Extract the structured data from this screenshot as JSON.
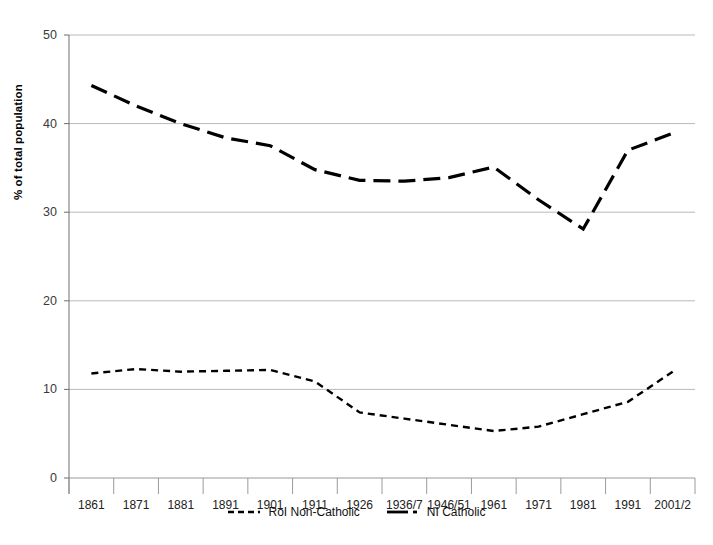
{
  "chart_data": {
    "type": "line",
    "title": "",
    "xlabel": "",
    "ylabel": "% of total population",
    "ylim": [
      0,
      50
    ],
    "yticks": [
      0,
      10,
      20,
      30,
      40,
      50
    ],
    "ytick_labels": [
      "0",
      "10",
      "20",
      "30",
      "40",
      "50"
    ],
    "grid": "horizontal",
    "legend_position": "bottom",
    "categories": [
      "1861",
      "1871",
      "1881",
      "1891",
      "1901",
      "1911",
      "1926",
      "1936/7",
      "1946/51",
      "1961",
      "1971",
      "1981",
      "1991",
      "2001/2"
    ],
    "series": [
      {
        "name": "RoI Non-Catholic",
        "style": "short-dash",
        "color": "#000000",
        "values": [
          11.8,
          12.3,
          12.0,
          12.1,
          12.2,
          10.9,
          7.4,
          6.7,
          6.0,
          5.3,
          5.8,
          7.2,
          8.6,
          12.0
        ]
      },
      {
        "name": "NI Catholic",
        "style": "long-dash",
        "color": "#000000",
        "values": [
          44.3,
          42.0,
          40.0,
          38.4,
          37.5,
          34.8,
          33.6,
          33.5,
          33.9,
          35.1,
          31.4,
          28.1,
          37.0,
          38.9
        ]
      }
    ]
  },
  "legend": {
    "entries": [
      {
        "label": "RoI Non-Catholic"
      },
      {
        "label": "NI Catholic"
      }
    ]
  },
  "axes": {
    "y_title": "% of total population"
  }
}
